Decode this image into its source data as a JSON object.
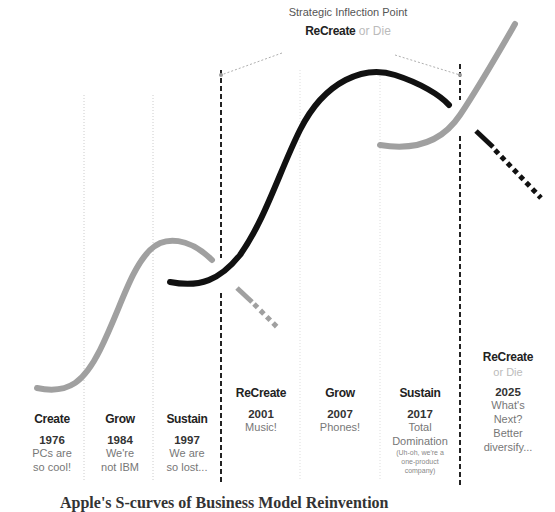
{
  "header": {
    "title": "Strategic Inflection Point",
    "subtitle_bold": "ReCreate",
    "subtitle_light": "or Die"
  },
  "columns": [
    {
      "phase": "Create",
      "year": "1976",
      "desc": [
        "PCs are",
        "so cool!"
      ]
    },
    {
      "phase": "Grow",
      "year": "1984",
      "desc": [
        "We're",
        "not IBM"
      ]
    },
    {
      "phase": "Sustain",
      "year": "1997",
      "desc": [
        "We are",
        "so lost..."
      ]
    },
    {
      "phase": "ReCreate",
      "year": "2001",
      "desc": [
        "Music!"
      ]
    },
    {
      "phase": "Grow",
      "year": "2007",
      "desc": [
        "Phones!"
      ]
    },
    {
      "phase": "Sustain",
      "year": "2017",
      "desc": [
        "Total",
        "Domination"
      ],
      "note": [
        "(Uh-oh, we're a",
        "one-product",
        "company)"
      ]
    },
    {
      "phase": "ReCreate",
      "phase2": "or Die",
      "year": "2025",
      "desc": [
        "What's",
        "Next?",
        "Better",
        "diversify..."
      ]
    }
  ],
  "caption": "Apple's S-curves of Business Model Reinvention",
  "colors": {
    "gray_curve": "#a0a0a0",
    "black_curve": "#111111",
    "dotted_line": "#cccccc",
    "dashed_line": "#222222"
  }
}
